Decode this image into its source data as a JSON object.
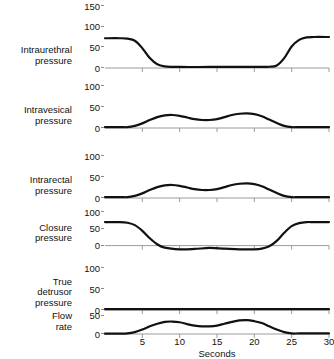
{
  "chart_data": {
    "type": "line",
    "title": "",
    "xlabel": "Seconds",
    "xlim": [
      0,
      30
    ],
    "xticks": [
      5,
      10,
      15,
      20,
      25,
      30
    ],
    "grid": false,
    "legend": null,
    "panels": [
      {
        "name": "intraurethral-pressure",
        "label": "Intraurethral\npressure",
        "ylabel": "",
        "ylim": [
          0,
          150
        ],
        "yticks": [
          0,
          50,
          100,
          150
        ],
        "x": [
          0,
          2,
          3,
          4,
          5,
          6,
          7,
          8,
          10,
          14,
          18,
          21,
          22,
          23,
          24,
          25,
          26,
          27,
          28,
          30
        ],
        "values": [
          72,
          72,
          71,
          66,
          48,
          24,
          9,
          4,
          2.5,
          2.5,
          2.5,
          2.5,
          3,
          6,
          24,
          52,
          68,
          74,
          75,
          75
        ]
      },
      {
        "name": "intravesical-pressure",
        "label": "Intravesical\npressure",
        "ylabel": "",
        "ylim": [
          0,
          100
        ],
        "yticks": [
          0,
          50,
          100
        ],
        "x": [
          0,
          2,
          3,
          4,
          5,
          6,
          7,
          8,
          9,
          10,
          11,
          12,
          13,
          14,
          15,
          16,
          17,
          18,
          19,
          20,
          21,
          22,
          23,
          24,
          25,
          26,
          28,
          30
        ],
        "values": [
          2,
          2,
          2,
          5,
          11,
          19,
          26,
          30,
          31,
          29,
          25,
          21,
          19,
          19,
          21,
          26,
          31,
          34,
          35,
          33,
          28,
          20,
          12,
          5,
          2,
          2,
          2,
          2
        ]
      },
      {
        "name": "intrarectal-pressure",
        "label": "Intrarectal\npressure",
        "ylabel": "",
        "ylim": [
          0,
          100
        ],
        "yticks": [
          0,
          50,
          100
        ],
        "x": [
          0,
          2,
          3,
          4,
          5,
          6,
          7,
          8,
          9,
          10,
          11,
          12,
          13,
          14,
          15,
          16,
          17,
          18,
          19,
          20,
          21,
          22,
          23,
          24,
          25,
          26,
          28,
          30
        ],
        "values": [
          2,
          2,
          2,
          5,
          11,
          19,
          26,
          30,
          31,
          29,
          25,
          21,
          19,
          19,
          21,
          26,
          31,
          34,
          35,
          33,
          28,
          20,
          12,
          5,
          2,
          2,
          2,
          2
        ]
      },
      {
        "name": "closure-pressure",
        "label": "Closure\npressure",
        "ylabel": "",
        "ylim": [
          -25,
          100
        ],
        "yticks": [
          0,
          50,
          100
        ],
        "x": [
          0,
          2,
          3,
          4,
          5,
          6,
          7,
          8,
          10,
          12,
          14,
          16,
          18,
          20,
          21,
          22,
          23,
          24,
          25,
          26,
          27,
          28,
          30
        ],
        "values": [
          70,
          70,
          68,
          61,
          44,
          22,
          4,
          -6,
          -11,
          -10,
          -7,
          -9,
          -11,
          -11,
          -9,
          -2,
          14,
          38,
          58,
          67,
          70,
          70,
          70
        ]
      },
      {
        "name": "true-detrusor-pressure",
        "label": "True\ndetrusor\npressure",
        "ylabel": "",
        "ylim": [
          0,
          100
        ],
        "yticks": [
          0,
          50,
          100
        ],
        "x": [
          0,
          5,
          10,
          15,
          20,
          25,
          30
        ],
        "values": [
          2,
          2,
          2,
          2,
          2,
          2,
          2
        ]
      },
      {
        "name": "flow-rate",
        "label": "Flow\nrate",
        "ylabel": "",
        "ylim": [
          0,
          60
        ],
        "yticks": [
          0,
          50
        ],
        "x": [
          0,
          2,
          3,
          4,
          5,
          6,
          7,
          8,
          9,
          10,
          11,
          12,
          13,
          14,
          15,
          16,
          17,
          18,
          19,
          20,
          21,
          22,
          23,
          24,
          25,
          26,
          28,
          30
        ],
        "values": [
          1,
          1,
          1.5,
          5,
          12,
          21,
          28,
          33,
          34,
          32,
          27,
          23,
          21,
          21,
          23,
          28,
          33,
          37,
          38,
          35,
          30,
          21,
          12,
          5,
          1.5,
          1.5,
          1.5,
          1.5
        ]
      }
    ],
    "colors": {
      "curve": "#111111",
      "axis": "#9a9a9a",
      "text": "#111111",
      "background": "#ffffff"
    }
  }
}
